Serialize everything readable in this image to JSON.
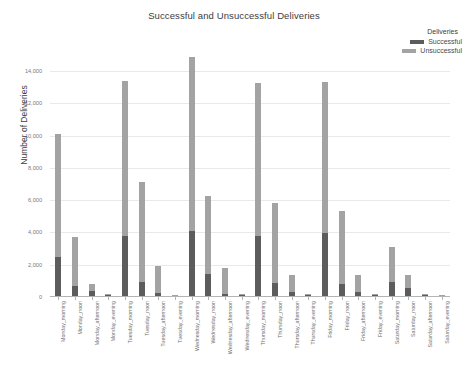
{
  "chart_data": {
    "type": "bar",
    "stacked": true,
    "title": "Successful and Unsuccessful Deliveries",
    "xlabel": "",
    "ylabel": "Number of Deliveries",
    "ylim": [
      0,
      15000
    ],
    "yticks": [
      0,
      2000,
      4000,
      6000,
      8000,
      10000,
      12000,
      14000
    ],
    "ytick_labels": [
      "0",
      "2,000",
      "4,000",
      "6,000",
      "8,000",
      "10,000",
      "12,000",
      "14,000"
    ],
    "grid": true,
    "legend_title": "Deliveries",
    "legend_position": "top-right",
    "categories": [
      "Monday_morning",
      "Monday_noon",
      "Monday_afternoon",
      "Monday_evening",
      "Tuesday_morning",
      "Tuesday_noon",
      "Tuesday_afternoon",
      "Tuesday_evening",
      "Wednesday_morning",
      "Wednesday_noon",
      "Wednesday_afternoon",
      "Wednesday_evening",
      "Thursday_morning",
      "Thursday_noon",
      "Thursday_afternoon",
      "Thursday_evening",
      "Friday_morning",
      "Friday_noon",
      "Friday_afternoon",
      "Friday_evening",
      "Saturday_morning",
      "Saturday_noon",
      "Saturday_afternoon",
      "Saturday_evening"
    ],
    "series": [
      {
        "name": "Successful",
        "color": "#5c5c5c",
        "values": [
          2500,
          700,
          350,
          150,
          3800,
          900,
          250,
          100,
          4100,
          1400,
          200,
          120,
          3800,
          850,
          300,
          130,
          3950,
          800,
          280,
          110,
          900,
          550,
          120,
          60
        ]
      },
      {
        "name": "Unsuccessful",
        "color": "#a3a3a3",
        "values": [
          7600,
          3050,
          450,
          60,
          9600,
          6250,
          1700,
          40,
          10800,
          4850,
          1600,
          60,
          9450,
          5000,
          1050,
          40,
          9350,
          4550,
          1100,
          50,
          2200,
          800,
          90,
          30
        ]
      }
    ],
    "totals": [
      10100,
      3750,
      800,
      210,
      13400,
      7150,
      1950,
      140,
      14900,
      6250,
      1800,
      180,
      13250,
      5850,
      1350,
      170,
      13300,
      5350,
      1380,
      160,
      3100,
      1350,
      210,
      90
    ]
  }
}
